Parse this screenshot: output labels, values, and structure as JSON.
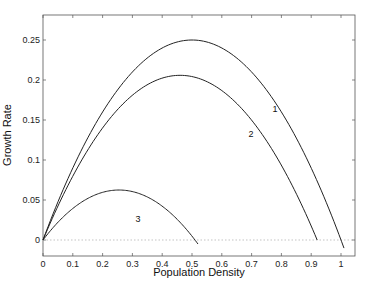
{
  "chart_data": {
    "type": "line",
    "title": "",
    "xlabel": "Population Density",
    "ylabel": "Growth Rate",
    "xlim": [
      0,
      1.05
    ],
    "ylim": [
      -0.02,
      0.27
    ],
    "xticks": [
      "0",
      "0.1",
      "0.2",
      "0.3",
      "0.4",
      "0.5",
      "0.6",
      "0.7",
      "0.8",
      "0.9",
      "1"
    ],
    "yticks": [
      "0",
      "0.05",
      "0.1",
      "0.15",
      "0.2",
      "0.25"
    ],
    "grid": false,
    "zero_line": "dotted",
    "series": [
      {
        "name": "1",
        "x": [
          0,
          0.1,
          0.2,
          0.3,
          0.4,
          0.5,
          0.6,
          0.7,
          0.8,
          0.9,
          1.0,
          1.01
        ],
        "values": [
          0,
          0.09,
          0.16,
          0.21,
          0.24,
          0.25,
          0.24,
          0.21,
          0.16,
          0.09,
          0.0,
          -0.01
        ]
      },
      {
        "name": "2",
        "x": [
          0,
          0.1,
          0.2,
          0.3,
          0.4,
          0.45,
          0.5,
          0.6,
          0.7,
          0.8,
          0.9,
          0.92
        ],
        "values": [
          0,
          0.08,
          0.143,
          0.183,
          0.2,
          0.202,
          0.2,
          0.183,
          0.143,
          0.08,
          0.0,
          -0.02
        ]
      },
      {
        "name": "3",
        "x": [
          0,
          0.05,
          0.1,
          0.15,
          0.2,
          0.25,
          0.3,
          0.35,
          0.4,
          0.45,
          0.5,
          0.52
        ],
        "values": [
          0,
          0.0225,
          0.04,
          0.0525,
          0.06,
          0.0625,
          0.06,
          0.0525,
          0.04,
          0.0225,
          0.0,
          -0.01
        ]
      }
    ],
    "annotations": [
      {
        "text": "1",
        "x": 0.77,
        "y": 0.16
      },
      {
        "text": "2",
        "x": 0.69,
        "y": 0.129
      },
      {
        "text": "3",
        "x": 0.31,
        "y": 0.023
      }
    ]
  }
}
